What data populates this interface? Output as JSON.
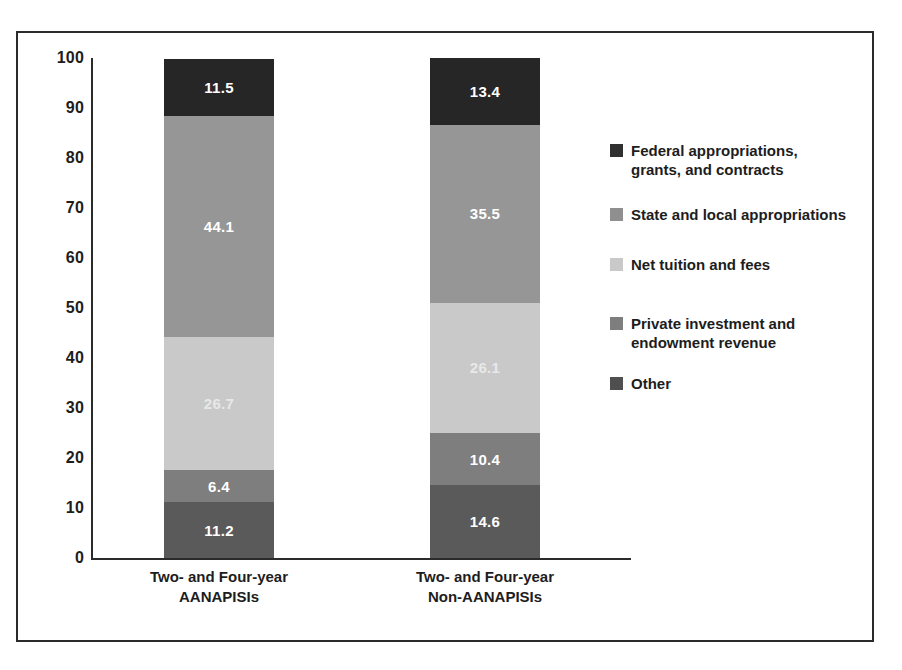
{
  "chart_data": {
    "type": "bar",
    "subtype": "stacked-bar-100",
    "title": "",
    "xlabel": "",
    "ylabel": "",
    "ylim": [
      0,
      100
    ],
    "yticks": [
      0,
      10,
      20,
      30,
      40,
      50,
      60,
      70,
      80,
      90,
      100
    ],
    "ytick_labels": [
      "0",
      "10",
      "20",
      "30",
      "40",
      "50",
      "60",
      "70",
      "80",
      "90",
      "100"
    ],
    "grid": false,
    "legend_position": "right",
    "categories": [
      "Two- and Four-year\nAANAPISIs",
      "Two- and Four-year\nNon-AANAPISIs"
    ],
    "stack_order_bottom_to_top": [
      "Other",
      "Private investment and endowment revenue",
      "Net tuition and fees",
      "State and local appropriations",
      "Federal appropriations, grants, and contracts"
    ],
    "series": [
      {
        "name": "Federal appropriations, grants, and contracts",
        "color": "#262626",
        "label_color": "#ffffff",
        "values": [
          11.5,
          13.4
        ]
      },
      {
        "name": "State and local appropriations",
        "color": "#969696",
        "label_color": "#ffffff",
        "values": [
          44.1,
          35.5
        ]
      },
      {
        "name": "Net tuition and fees",
        "color": "#c9c9c9",
        "label_color": "#e8e8e8",
        "values": [
          26.7,
          26.1
        ]
      },
      {
        "name": "Private investment and endowment revenue",
        "color": "#7e7e7e",
        "label_color": "#ffffff",
        "values": [
          6.4,
          10.4
        ]
      },
      {
        "name": "Other",
        "color": "#5a5a5a",
        "label_color": "#ffffff",
        "values": [
          11.2,
          14.6
        ]
      }
    ],
    "data_labels": [
      [
        "11.5",
        "44.1",
        "26.7",
        "6.4",
        "11.2"
      ],
      [
        "13.4",
        "35.5",
        "26.1",
        "10.4",
        "14.6"
      ]
    ]
  },
  "legend": {
    "items": [
      {
        "label": "Federal appropriations,\ngrants, and contracts",
        "color": "#303030"
      },
      {
        "label": "State and local appropriations",
        "color": "#8f8f8f"
      },
      {
        "label": "Net tuition and fees",
        "color": "#c9c9c9"
      },
      {
        "label": "Private investment and\nendowment revenue",
        "color": "#7e7e7e"
      },
      {
        "label": "Other",
        "color": "#4f4f4f"
      }
    ]
  },
  "axis": {
    "y_ticks": [
      "100",
      "90",
      "80",
      "70",
      "60",
      "50",
      "40",
      "30",
      "20",
      "10",
      "0"
    ],
    "x_labels": [
      "Two- and Four-year\nAANAPISIs",
      "Two- and Four-year\nNon-AANAPISIs"
    ]
  },
  "colors": {
    "frame": "#2b2b2b",
    "axis": "#2b2b2b",
    "background": "#ffffff",
    "text": "#1d1d1d"
  }
}
